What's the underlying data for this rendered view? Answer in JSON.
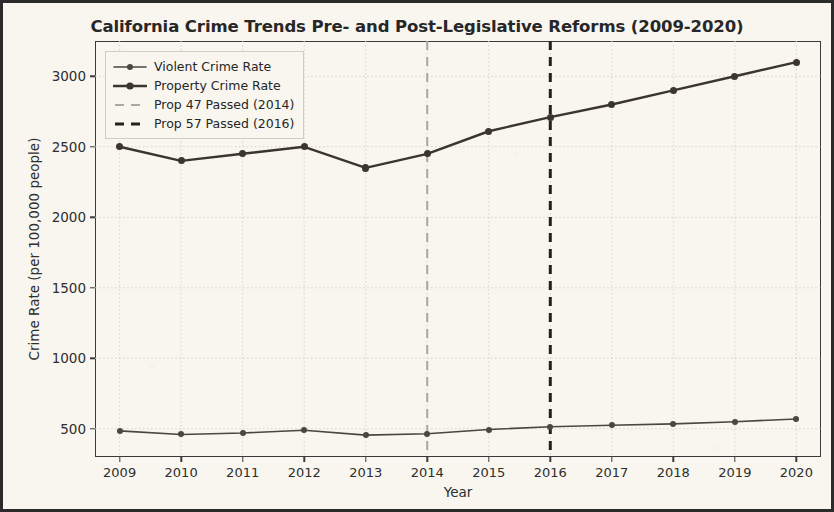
{
  "chart_data": {
    "type": "line",
    "title": "California Crime Trends Pre- and Post-Legislative Reforms (2009-2020)",
    "xlabel": "Year",
    "ylabel": "Crime Rate (per 100,000 people)",
    "x": [
      2009,
      2010,
      2011,
      2012,
      2013,
      2014,
      2015,
      2016,
      2017,
      2018,
      2019,
      2020
    ],
    "xtick_labels": [
      "2009",
      "2010",
      "2011",
      "2012",
      "2013",
      "2014",
      "2015",
      "2016",
      "2017",
      "2018",
      "2019",
      "2020"
    ],
    "ytick_labels": [
      "500",
      "1000",
      "1500",
      "2000",
      "2500",
      "3000"
    ],
    "ytick_values": [
      500,
      1000,
      1500,
      2000,
      2500,
      3000
    ],
    "ylim": [
      300,
      3250
    ],
    "xlim": [
      2008.6,
      2020.4
    ],
    "grid": true,
    "legend_position": "upper left",
    "series": [
      {
        "name": "Violent Crime Rate",
        "values": [
          485,
          460,
          470,
          490,
          455,
          465,
          495,
          515,
          525,
          535,
          550,
          570
        ],
        "color": "#4a4740",
        "linewidth": 1.6,
        "marker": "o"
      },
      {
        "name": "Property Crime Rate",
        "values": [
          2500,
          2400,
          2450,
          2500,
          2350,
          2450,
          2610,
          2710,
          2800,
          2900,
          3000,
          3100
        ],
        "color": "#3a362f",
        "linewidth": 2.4,
        "marker": "o"
      }
    ],
    "vlines": [
      {
        "label": "Prop 47 Passed (2014)",
        "x": 2014,
        "color": "#aaa79c",
        "style": "dashed",
        "linewidth": 2
      },
      {
        "label": "Prop 57 Passed (2016)",
        "x": 2016,
        "color": "#24211c",
        "style": "dashed",
        "linewidth": 3
      }
    ],
    "legend_entries": [
      {
        "label": "Violent Crime Rate",
        "kind": "line-marker",
        "color": "#4a4740",
        "linewidth": 1.6
      },
      {
        "label": "Property Crime Rate",
        "kind": "line-marker",
        "color": "#3a362f",
        "linewidth": 2.6
      },
      {
        "label": "Prop 47 Passed (2014)",
        "kind": "dashed",
        "color": "#aaa79c",
        "linewidth": 2
      },
      {
        "label": "Prop 57 Passed (2016)",
        "kind": "dashed",
        "color": "#24211c",
        "linewidth": 3
      }
    ],
    "colors": {
      "background": "#f8f6ef",
      "frame": "#3a3a3a",
      "grid": "#d6d3c7",
      "text": "#2e2e2e",
      "figure_border": "#2b2b2b"
    }
  }
}
